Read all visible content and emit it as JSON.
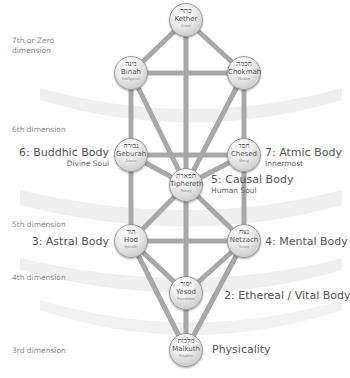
{
  "colors": {
    "path": "#a8a8a8",
    "band": "#d9d9d9",
    "dimension_text": "#8a8a8a",
    "label_text": "#555555"
  },
  "dimensions": [
    {
      "label": "7th or Zero dimension",
      "line1": "7th or Zero",
      "line2": "dimension"
    },
    {
      "label": "6th dimension"
    },
    {
      "label": "5th dimension"
    },
    {
      "label": "4th dimension"
    },
    {
      "label": "3rd dimension"
    }
  ],
  "sephiroth": [
    {
      "id": "kether",
      "hebrew": "כתר",
      "name": "Kether",
      "meaning": "Crown",
      "x": 186,
      "y": 20
    },
    {
      "id": "binah",
      "hebrew": "בינה",
      "name": "Binah",
      "meaning": "Intelligence",
      "x": 131,
      "y": 73
    },
    {
      "id": "chokmah",
      "hebrew": "חכמה",
      "name": "Chokmah",
      "meaning": "Wisdom",
      "x": 244,
      "y": 73
    },
    {
      "id": "geburah",
      "hebrew": "גבורה",
      "name": "Geburah",
      "meaning": "Justice",
      "x": 131,
      "y": 155
    },
    {
      "id": "chesed",
      "hebrew": "חסד",
      "name": "Chesed",
      "meaning": "Mercy",
      "x": 244,
      "y": 155
    },
    {
      "id": "tiphereth",
      "hebrew": "תפארת",
      "name": "Tiphereth",
      "meaning": "Beauty",
      "x": 186,
      "y": 185
    },
    {
      "id": "hod",
      "hebrew": "הוד",
      "name": "Hod",
      "meaning": "Splendor",
      "x": 131,
      "y": 241
    },
    {
      "id": "netzach",
      "hebrew": "נצח",
      "name": "Netzach",
      "meaning": "Victory",
      "x": 244,
      "y": 241
    },
    {
      "id": "yesod",
      "hebrew": "יסוד",
      "name": "Yesod",
      "meaning": "Foundation",
      "x": 186,
      "y": 293
    },
    {
      "id": "malkuth",
      "hebrew": "מלכות",
      "name": "Malkuth",
      "meaning": "Kingdom",
      "x": 186,
      "y": 350
    }
  ],
  "bodies": [
    {
      "id": "buddhic",
      "title": "6: Buddhic Body",
      "subtitle": "Divine Soul",
      "side": "left"
    },
    {
      "id": "atmic",
      "title": "7: Atmic Body",
      "subtitle": "Innermost",
      "side": "right"
    },
    {
      "id": "causal",
      "title": "5: Causal Body",
      "subtitle": "Human Soul",
      "side": "right"
    },
    {
      "id": "astral",
      "title": "3: Astral Body",
      "subtitle": "",
      "side": "left"
    },
    {
      "id": "mental",
      "title": "4: Mental Body",
      "subtitle": "",
      "side": "right"
    },
    {
      "id": "ethereal",
      "title": "2: Ethereal / Vital Body",
      "subtitle": "",
      "side": "right"
    },
    {
      "id": "physicality",
      "title": "Physicality",
      "subtitle": "",
      "side": "right"
    }
  ]
}
